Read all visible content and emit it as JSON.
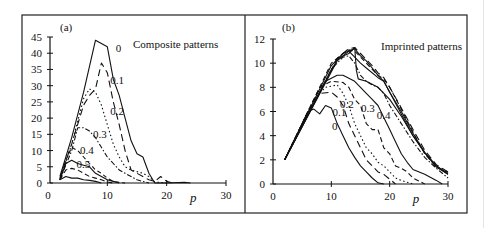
{
  "figure": {
    "panels": [
      {
        "id": "a",
        "panel_label": "(a)",
        "title": "Composite patterns"
      },
      {
        "id": "b",
        "panel_label": "(b)",
        "title": "Imprinted patterns"
      }
    ]
  },
  "chart_data": [
    {
      "type": "line",
      "panel_label": "(a)",
      "title": "Composite patterns",
      "xlabel": "p",
      "ylabel": "",
      "xlim": [
        0,
        30
      ],
      "ylim": [
        0,
        45
      ],
      "xticks": [
        0,
        10,
        20,
        30
      ],
      "yticks": [
        0,
        5,
        10,
        15,
        20,
        25,
        30,
        35,
        40,
        45
      ],
      "grid": false,
      "legend": "inline curve labels",
      "series": [
        {
          "name": "0",
          "style": "solid",
          "x": [
            2,
            4,
            6,
            8,
            9,
            10,
            11,
            12,
            13,
            14,
            15,
            16,
            17,
            18,
            20,
            23,
            24
          ],
          "y": [
            2,
            14,
            28,
            44,
            43,
            42,
            32,
            27,
            20,
            13,
            9,
            8,
            3,
            0,
            0,
            0.2,
            0
          ]
        },
        {
          "name": "0.1",
          "style": "long-dash",
          "x": [
            2,
            4,
            6,
            7,
            8,
            9,
            10,
            11,
            12,
            13,
            14,
            15,
            16,
            17,
            18,
            19,
            20,
            21
          ],
          "y": [
            1.5,
            12,
            24,
            27,
            29,
            37,
            34,
            25,
            18,
            10,
            4,
            3,
            2,
            1,
            0.5,
            2,
            0.5,
            0
          ]
        },
        {
          "name": "0.2",
          "style": "dotted",
          "x": [
            2,
            4,
            6,
            7,
            8,
            9,
            10,
            11,
            12,
            13,
            14,
            15,
            16,
            17,
            18,
            20
          ],
          "y": [
            1,
            12,
            26,
            29,
            28,
            24,
            18,
            12,
            8,
            5,
            4,
            3.5,
            3,
            2,
            0.3,
            0
          ]
        },
        {
          "name": "0.3",
          "style": "dash-dot",
          "x": [
            2,
            4,
            5,
            6,
            7,
            8,
            9,
            10,
            11,
            12,
            13,
            14,
            15,
            16,
            17
          ],
          "y": [
            1,
            10,
            17,
            17,
            16,
            14,
            11,
            8,
            6,
            4,
            3,
            2,
            1,
            0.5,
            0
          ]
        },
        {
          "name": "0.4",
          "style": "short-dash",
          "x": [
            2,
            3,
            4,
            5,
            6,
            7,
            8,
            9,
            10,
            11,
            12,
            13
          ],
          "y": [
            1,
            7,
            11,
            10,
            8,
            6,
            4,
            3,
            1.5,
            0.5,
            0.2,
            0
          ]
        },
        {
          "name": "0.5",
          "style": "solid",
          "x": [
            2,
            3,
            4,
            5,
            6,
            7,
            8,
            9,
            10,
            11,
            12
          ],
          "y": [
            1,
            6,
            7,
            6,
            5.5,
            5,
            3,
            2,
            1,
            0.5,
            0
          ]
        },
        {
          "name": "0.6",
          "style": "dash",
          "x": [
            2,
            3,
            4,
            5,
            6,
            7,
            8,
            9,
            10,
            11
          ],
          "y": [
            1,
            4,
            4.5,
            4,
            3,
            2,
            1.5,
            1,
            0.3,
            0
          ]
        },
        {
          "name": "0.7",
          "style": "solid",
          "x": [
            2,
            3,
            4,
            5,
            6,
            7,
            8,
            9
          ],
          "y": [
            1,
            2,
            1.5,
            1.5,
            1,
            0.8,
            0.5,
            0
          ]
        }
      ],
      "curve_labels": [
        {
          "text": "0",
          "x": 11.4,
          "y": 40.5
        },
        {
          "text": "0.1",
          "x": 10.5,
          "y": 30.5
        },
        {
          "text": "0.2",
          "x": 10.5,
          "y": 21
        },
        {
          "text": "0.3",
          "x": 7.6,
          "y": 14
        },
        {
          "text": "0.4",
          "x": 5.4,
          "y": 9
        },
        {
          "text": "0.5",
          "x": 4.8,
          "y": 4.6
        }
      ]
    },
    {
      "type": "line",
      "panel_label": "(b)",
      "title": "Imprinted patterns",
      "xlabel": "p",
      "ylabel": "",
      "xlim": [
        0,
        30
      ],
      "ylim": [
        0,
        12
      ],
      "xticks": [
        0,
        10,
        20,
        30
      ],
      "yticks": [
        0,
        2,
        4,
        6,
        8,
        10,
        12
      ],
      "grid": false,
      "legend": "inline curve labels",
      "series": [
        {
          "name": "0",
          "style": "solid",
          "x": [
            2,
            6,
            7,
            8,
            9,
            10,
            11,
            12,
            13,
            14,
            15,
            16,
            17,
            18,
            19
          ],
          "y": [
            2,
            6,
            6.2,
            5.8,
            6.5,
            6.3,
            5,
            4,
            3,
            2.2,
            1.5,
            1,
            0.5,
            0.1,
            0
          ]
        },
        {
          "name": "0.1",
          "style": "long-dash",
          "x": [
            2,
            6,
            8,
            10,
            11,
            12,
            13,
            14,
            15,
            16,
            17,
            18,
            19,
            20,
            21
          ],
          "y": [
            2,
            6,
            7.5,
            7.6,
            7.2,
            6.5,
            5,
            4,
            3,
            2,
            1.5,
            1,
            0.8,
            0.4,
            0
          ]
        },
        {
          "name": "0.2",
          "style": "dotted",
          "x": [
            2,
            7,
            9,
            11,
            12,
            13,
            14,
            15,
            16,
            17,
            18,
            19,
            20,
            21,
            22,
            24
          ],
          "y": [
            2,
            7,
            8,
            8.2,
            7.5,
            6.5,
            5,
            4,
            3,
            2.5,
            1.8,
            1.5,
            1,
            0.5,
            0.3,
            0
          ]
        },
        {
          "name": "0.3",
          "style": "dash",
          "x": [
            2,
            8,
            10,
            12,
            13,
            14,
            15,
            16,
            17,
            18,
            19,
            20,
            21,
            22,
            23,
            24,
            26
          ],
          "y": [
            2,
            8,
            8.5,
            8.4,
            8,
            7,
            6.5,
            5,
            4.5,
            4.5,
            3,
            2.5,
            1.5,
            1.3,
            1,
            0.5,
            0
          ]
        },
        {
          "name": "0.4",
          "style": "solid",
          "x": [
            2,
            9,
            11,
            12,
            14,
            15,
            16,
            17,
            18,
            19,
            20,
            21,
            22,
            23,
            24,
            26,
            28,
            29
          ],
          "y": [
            2,
            8.5,
            9,
            9,
            8.5,
            8,
            7.5,
            7,
            6.5,
            5.5,
            4.5,
            3.5,
            2.5,
            1.8,
            1.2,
            0.8,
            0.3,
            0
          ]
        },
        {
          "name": "0.5",
          "style": "dash-dot",
          "x": [
            2,
            10,
            12,
            13,
            14,
            15,
            16,
            17,
            18,
            19,
            20,
            22,
            24,
            26,
            28,
            30
          ],
          "y": [
            2,
            9.5,
            10.5,
            10.6,
            10,
            9,
            8.5,
            8.2,
            8,
            7.5,
            6.5,
            5,
            3.5,
            2.2,
            1.3,
            0.5
          ]
        },
        {
          "name": "0.6",
          "style": "solid",
          "x": [
            2,
            10,
            12,
            13,
            14,
            15,
            16,
            18,
            19,
            20,
            22,
            24,
            26,
            28,
            30
          ],
          "y": [
            2,
            9.8,
            10.8,
            11,
            10.5,
            10,
            9.6,
            8.8,
            8.5,
            7.6,
            5.8,
            4,
            2.6,
            1.4,
            0.8
          ]
        },
        {
          "name": "0.7",
          "style": "dash",
          "x": [
            2,
            10,
            12,
            13,
            14,
            15,
            16,
            18,
            19,
            20,
            22,
            24,
            26,
            28,
            30
          ],
          "y": [
            2,
            10,
            10.8,
            11.1,
            11,
            10.5,
            10,
            9,
            8.7,
            8,
            6.2,
            4.3,
            2.5,
            1.4,
            1
          ]
        },
        {
          "name": "0.8",
          "style": "solid",
          "x": [
            2,
            11,
            12,
            13,
            14,
            15,
            16,
            17,
            18,
            19,
            20,
            22,
            24,
            26,
            28,
            30
          ],
          "y": [
            2,
            10.3,
            10.6,
            11,
            11.2,
            10.6,
            10.2,
            9.6,
            9,
            8.5,
            7.6,
            6,
            4.2,
            2.6,
            1.5,
            0.9
          ]
        },
        {
          "name": "0.9",
          "style": "long-dash",
          "x": [
            2,
            11,
            12,
            13,
            14,
            15,
            16,
            17,
            18,
            19,
            20,
            22,
            24,
            26,
            28,
            30
          ],
          "y": [
            2,
            10.4,
            10.8,
            11.2,
            11.3,
            10.8,
            10.3,
            9.8,
            9.2,
            8.8,
            8,
            6.3,
            4.5,
            2.8,
            1.6,
            1
          ]
        },
        {
          "name": "1",
          "style": "solid",
          "x": [
            2,
            11,
            12,
            13,
            14,
            14.3,
            14.6,
            16,
            18,
            20,
            22,
            24,
            26,
            28,
            30
          ],
          "y": [
            2,
            10.2,
            10.6,
            10.8,
            11.3,
            9.4,
            8.7,
            8.5,
            8,
            7,
            5.6,
            4,
            2.6,
            1.5,
            0.8
          ]
        }
      ],
      "curve_labels": [
        {
          "text": "0.2",
          "x": 11.5,
          "y": 6.3
        },
        {
          "text": "0.1",
          "x": 10.2,
          "y": 5.6
        },
        {
          "text": "0.3",
          "x": 15.1,
          "y": 6.0
        },
        {
          "text": "0.4",
          "x": 17.8,
          "y": 5.4
        },
        {
          "text": "0",
          "x": 10.1,
          "y": 4.5
        }
      ]
    }
  ]
}
